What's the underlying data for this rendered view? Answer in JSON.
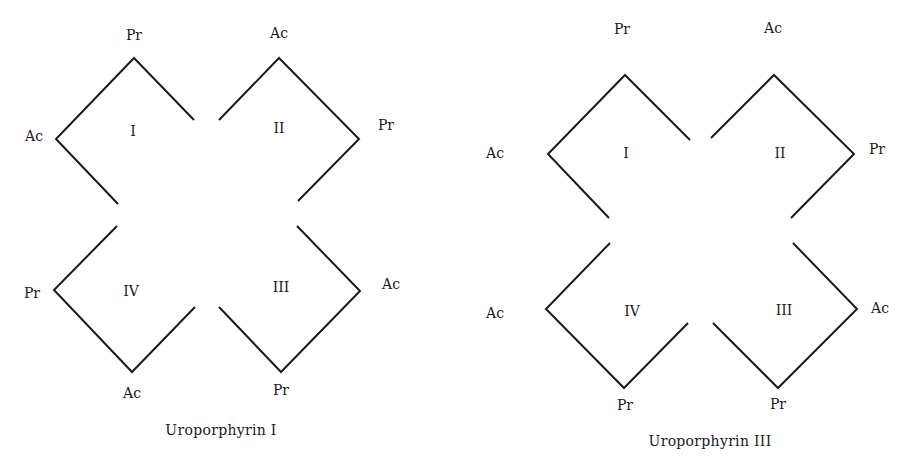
{
  "diagrams": [
    {
      "title": "Uroporphyrin I",
      "rings": [
        {
          "numeral": "I",
          "outer_top": "Pr",
          "outer_side": "Ac"
        },
        {
          "numeral": "II",
          "outer_top": "Ac",
          "outer_side": "Pr"
        },
        {
          "numeral": "III",
          "outer_side": "Ac",
          "outer_bottom": "Pr"
        },
        {
          "numeral": "IV",
          "outer_side": "Pr",
          "outer_bottom": "Ac"
        }
      ]
    },
    {
      "title": "Uroporphyrin III",
      "rings": [
        {
          "numeral": "I",
          "outer_top": "Pr",
          "outer_side": "Ac"
        },
        {
          "numeral": "II",
          "outer_top": "Ac",
          "outer_side": "Pr"
        },
        {
          "numeral": "III",
          "outer_side": "Ac",
          "outer_bottom": "Pr"
        },
        {
          "numeral": "IV",
          "outer_side": "Ac",
          "outer_bottom": "Pr"
        }
      ]
    }
  ],
  "stroke_color": "#1a1a1a"
}
